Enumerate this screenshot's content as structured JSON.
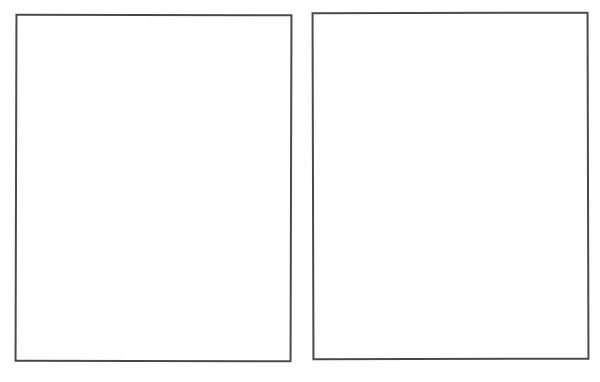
{
  "pages": [
    {
      "name": "left-page",
      "content": ""
    },
    {
      "name": "right-page",
      "content": ""
    }
  ],
  "colors": {
    "background": "#ffffff",
    "border": "#4a4a4a"
  }
}
